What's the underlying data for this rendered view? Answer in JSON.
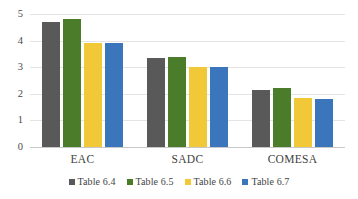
{
  "chart_data": {
    "type": "bar",
    "title": "",
    "subtitle": "",
    "xlabel": "",
    "ylabel": "",
    "categories": [
      "EAC",
      "SADC",
      "COMESA"
    ],
    "series": [
      {
        "name": "Table 6.4",
        "color": "#595959",
        "values": [
          4.7,
          3.35,
          2.15
        ]
      },
      {
        "name": "Table 6.5",
        "color": "#4b7c2a",
        "values": [
          4.8,
          3.4,
          2.2
        ]
      },
      {
        "name": "Table 6.6",
        "color": "#f0c838",
        "values": [
          3.9,
          3.0,
          1.85
        ]
      },
      {
        "name": "Table 6.7",
        "color": "#3b76bc",
        "values": [
          3.9,
          3.0,
          1.8
        ]
      }
    ],
    "ylim": [
      0,
      5
    ],
    "yticks": [
      0,
      1,
      2,
      3,
      4,
      5
    ],
    "ytick_labels": [
      "0",
      "1",
      "2",
      "3",
      "4",
      "5"
    ],
    "grid": true,
    "legend_position": "bottom"
  }
}
